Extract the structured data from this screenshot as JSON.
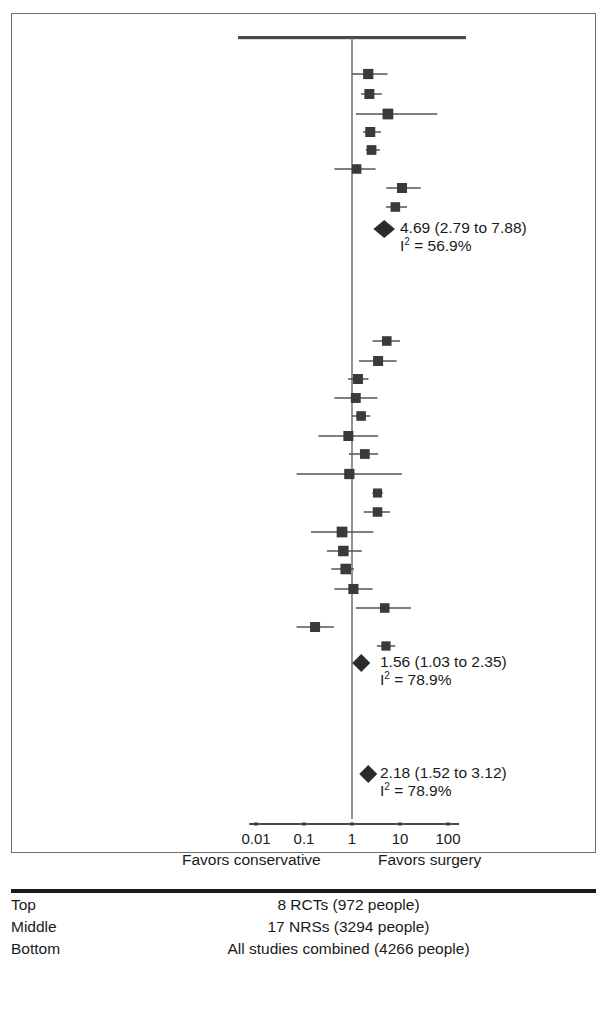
{
  "chart_data": {
    "type": "forest",
    "title": "",
    "xlabel": "",
    "ylabel": "",
    "x_scale": "log",
    "xlim": [
      0.01,
      100
    ],
    "ticks": [
      {
        "label": "0.01",
        "value": 0.01
      },
      {
        "label": "0.1",
        "value": 0.1
      },
      {
        "label": "1",
        "value": 1
      },
      {
        "label": "10",
        "value": 10
      },
      {
        "label": "100",
        "value": 100
      }
    ],
    "null_line": 1,
    "left_direction_label": "Favors conservative",
    "right_direction_label": "Favors surgery",
    "groups": [
      {
        "name": "Top",
        "studies": [
          {
            "est": 2.18,
            "lo": 1.0,
            "hi": 5.5,
            "size": 0.85
          },
          {
            "est": 2.3,
            "lo": 1.55,
            "hi": 4.2,
            "size": 0.8
          },
          {
            "est": 5.6,
            "lo": 1.2,
            "hi": 60.0,
            "size": 0.95
          },
          {
            "est": 2.4,
            "lo": 1.7,
            "hi": 4.0,
            "size": 0.8
          },
          {
            "est": 2.55,
            "lo": 1.95,
            "hi": 3.8,
            "size": 0.75
          },
          {
            "est": 1.25,
            "lo": 0.43,
            "hi": 3.1,
            "size": 0.7
          },
          {
            "est": 11.0,
            "lo": 5.2,
            "hi": 27.0,
            "size": 0.8
          },
          {
            "est": 8.0,
            "lo": 5.1,
            "hi": 14.0,
            "size": 0.72
          }
        ],
        "summary": {
          "est": 4.69,
          "lo": 2.79,
          "hi": 7.88,
          "text": "4.69 (2.79 to 7.88)",
          "heterogeneity_value": "56.9%",
          "heterogeneity_prefix": "I",
          "heterogeneity_sup": "2",
          "heterogeneity_eq": " = "
        }
      },
      {
        "name": "Middle",
        "studies": [
          {
            "est": 5.3,
            "lo": 2.7,
            "hi": 10.0,
            "size": 0.72
          },
          {
            "est": 3.5,
            "lo": 1.4,
            "hi": 8.5,
            "size": 0.8
          },
          {
            "est": 1.33,
            "lo": 0.83,
            "hi": 2.2,
            "size": 0.8
          },
          {
            "est": 1.2,
            "lo": 0.43,
            "hi": 3.4,
            "size": 0.78
          },
          {
            "est": 1.55,
            "lo": 1.0,
            "hi": 2.4,
            "size": 0.72
          },
          {
            "est": 0.84,
            "lo": 0.2,
            "hi": 3.5,
            "size": 0.8
          },
          {
            "est": 1.85,
            "lo": 0.86,
            "hi": 3.5,
            "size": 0.75
          },
          {
            "est": 0.88,
            "lo": 0.07,
            "hi": 11.0,
            "size": 0.85
          },
          {
            "est": 3.4,
            "lo": 2.65,
            "hi": 4.4,
            "size": 0.62
          },
          {
            "est": 3.4,
            "lo": 1.75,
            "hi": 6.2,
            "size": 0.7
          },
          {
            "est": 0.62,
            "lo": 0.14,
            "hi": 2.8,
            "size": 0.95
          },
          {
            "est": 0.66,
            "lo": 0.3,
            "hi": 1.6,
            "size": 0.9
          },
          {
            "est": 0.74,
            "lo": 0.37,
            "hi": 1.1,
            "size": 0.92
          },
          {
            "est": 1.07,
            "lo": 0.43,
            "hi": 2.7,
            "size": 0.82
          },
          {
            "est": 4.8,
            "lo": 1.2,
            "hi": 17.0,
            "size": 0.72
          },
          {
            "est": 0.17,
            "lo": 0.07,
            "hi": 0.42,
            "size": 0.8
          },
          {
            "est": 5.1,
            "lo": 3.3,
            "hi": 8.0,
            "size": 0.65
          }
        ],
        "summary": {
          "est": 1.56,
          "lo": 1.03,
          "hi": 2.35,
          "text": "1.56 (1.03 to 2.35)",
          "heterogeneity_value": "78.9%",
          "heterogeneity_prefix": "I",
          "heterogeneity_sup": "2",
          "heterogeneity_eq": " = "
        }
      },
      {
        "name": "Bottom",
        "studies": [],
        "summary": {
          "est": 2.18,
          "lo": 1.52,
          "hi": 3.12,
          "text": "2.18 (1.52 to 3.12)",
          "heterogeneity_value": "78.9%",
          "heterogeneity_prefix": "I",
          "heterogeneity_sup": "2",
          "heterogeneity_eq": " = "
        }
      }
    ]
  },
  "legend_table": {
    "rows": [
      {
        "position": "Top",
        "description": "8 RCTs (972 people)"
      },
      {
        "position": "Middle",
        "description": "17 NRSs (3294 people)"
      },
      {
        "position": "Bottom",
        "description": "All studies combined (4266 people)"
      }
    ]
  },
  "colors": {
    "ink": "#1a1a1a",
    "marker": "#3a3a3a",
    "line": "#555555",
    "frame": "#6f6f6f"
  }
}
